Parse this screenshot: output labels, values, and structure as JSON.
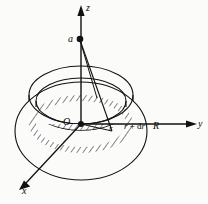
{
  "figure": {
    "background_color": "#fbfbfa",
    "stroke_color": "#111111",
    "axes": [
      {
        "id": "z",
        "label": "z",
        "direction": "up",
        "arrow": true
      },
      {
        "id": "y",
        "label": "y",
        "direction": "right",
        "arrow": true
      },
      {
        "id": "x",
        "label": "x",
        "direction": "down-left",
        "arrow": true
      }
    ],
    "points": [
      {
        "id": "origin",
        "label": "O",
        "marker": "filled-dot",
        "on_axis": "z-y-x"
      },
      {
        "id": "field-point",
        "label": "a",
        "marker": "filled-dot",
        "on_axis": "z"
      }
    ],
    "radial_labels": [
      {
        "id": "inner-radius",
        "label": "r"
      },
      {
        "id": "outer-edge-of-ring",
        "label": "r + dr"
      },
      {
        "id": "disc-radius",
        "label": "R"
      }
    ],
    "shapes": [
      {
        "id": "disc-outline",
        "kind": "ellipse",
        "description": "outer disc of radius R seen in perspective"
      },
      {
        "id": "ring-annulus",
        "kind": "annulus",
        "description": "hatched elemental ring between r and r+dr",
        "hatched": true
      },
      {
        "id": "ring-side",
        "kind": "band",
        "description": "shaded near-side band of the ring giving thickness"
      }
    ],
    "connector_lines": [
      {
        "id": "a-to-origin",
        "from": "a",
        "to": "O"
      },
      {
        "id": "a-to-ring-edge",
        "from": "a",
        "to": "ring"
      },
      {
        "id": "origin-to-ring-1",
        "from": "O",
        "to": "ring"
      },
      {
        "id": "origin-to-ring-2",
        "from": "O",
        "to": "ring"
      }
    ]
  },
  "labels": {
    "z": "z",
    "a": "a",
    "O": "O",
    "r": "r",
    "r_plus_dr_var": "r",
    "r_plus_dr_op": " + ",
    "r_plus_dr_d": "d",
    "r_plus_dr_tail": "r",
    "R": "R",
    "y": "y",
    "x": "x"
  }
}
